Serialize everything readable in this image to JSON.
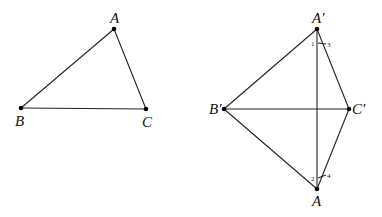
{
  "figure_left": {
    "title": "Triangle ABC",
    "points": {
      "A": {
        "label": "A",
        "x": 114,
        "y": 29
      },
      "B": {
        "label": "B",
        "x": 21,
        "y": 108
      },
      "C": {
        "label": "C",
        "x": 146,
        "y": 109
      }
    },
    "segments": [
      [
        "A",
        "B"
      ],
      [
        "B",
        "C"
      ],
      [
        "C",
        "A"
      ]
    ]
  },
  "figure_right": {
    "title": "Quadrilateral A'B'AC' with diagonals",
    "points": {
      "A1": {
        "label": "A′",
        "x": 317,
        "y": 29
      },
      "B1": {
        "label": "B′",
        "x": 224,
        "y": 109
      },
      "C1": {
        "label": "C′",
        "x": 349,
        "y": 109
      },
      "A": {
        "label": "A",
        "x": 317,
        "y": 189
      }
    },
    "segments": [
      [
        "A1",
        "B1"
      ],
      [
        "A1",
        "C1"
      ],
      [
        "B1",
        "C1"
      ],
      [
        "B1",
        "A"
      ],
      [
        "C1",
        "A"
      ],
      [
        "A1",
        "A"
      ]
    ],
    "angle_labels": {
      "one": "1",
      "two": "2",
      "three": "3",
      "four": "4"
    }
  }
}
